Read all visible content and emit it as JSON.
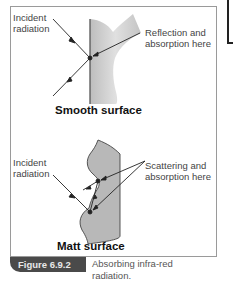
{
  "smooth": {
    "incident_label": "Incident\nradiation",
    "reflection_label": "Reflection and\nabsorption here",
    "title": "Smooth surface"
  },
  "matt": {
    "incident_label": "Incident\nradiation",
    "scattering_label": "Scattering and\nabsorption here",
    "title": "Matt surface"
  },
  "figure": {
    "number": "Figure 6.9.2",
    "caption": "Absorbing infra-red radiation."
  },
  "colors": {
    "surface_fill": "#c8c8c8",
    "figure_tab": "#4a4a4a",
    "frame_border": "#9a9a9a"
  }
}
